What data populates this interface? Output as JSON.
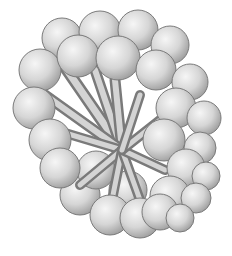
{
  "figure": {
    "background": "#ffffff",
    "sphere_fill_light": "#f2f2f2",
    "sphere_fill_dark": "#a8a8a8",
    "sphere_stroke": "#7a7a7a",
    "duct_light": "#d8d8d8",
    "duct_dark": "#6e6e6e",
    "spheres": [
      [
        62,
        38,
        20
      ],
      [
        100,
        32,
        21
      ],
      [
        138,
        30,
        20
      ],
      [
        170,
        45,
        19
      ],
      [
        40,
        70,
        21
      ],
      [
        78,
        56,
        21
      ],
      [
        118,
        58,
        22
      ],
      [
        156,
        70,
        20
      ],
      [
        190,
        82,
        18
      ],
      [
        34,
        108,
        21
      ],
      [
        176,
        108,
        20
      ],
      [
        204,
        118,
        17
      ],
      [
        50,
        140,
        21
      ],
      [
        164,
        140,
        21
      ],
      [
        200,
        148,
        16
      ],
      [
        60,
        168,
        20
      ],
      [
        186,
        168,
        19
      ],
      [
        206,
        176,
        14
      ],
      [
        80,
        195,
        20
      ],
      [
        170,
        196,
        20
      ],
      [
        196,
        198,
        15
      ],
      [
        110,
        215,
        20
      ],
      [
        140,
        218,
        20
      ],
      [
        160,
        212,
        18
      ],
      [
        96,
        170,
        19
      ],
      [
        128,
        190,
        19
      ],
      [
        180,
        218,
        14
      ]
    ]
  }
}
